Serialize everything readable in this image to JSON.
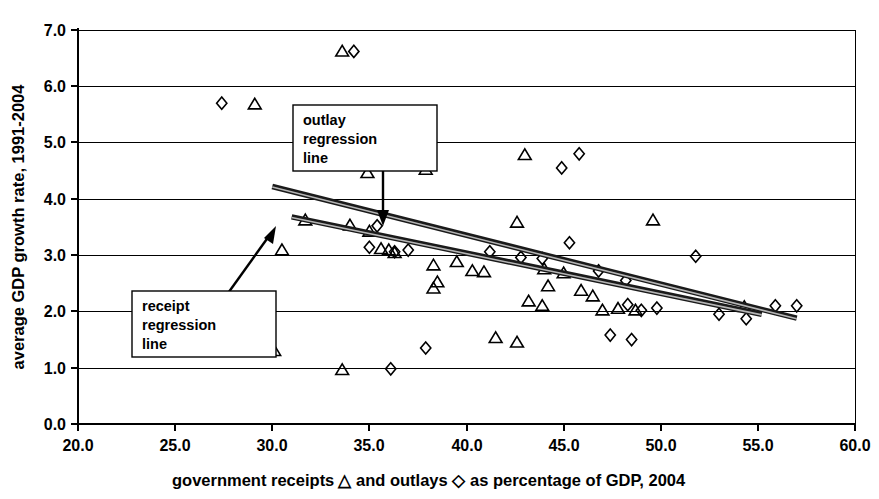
{
  "chart_data": {
    "type": "scatter",
    "title": "",
    "xlabel": "government receipts △ and outlays ◇ as percentage of GDP, 2004",
    "ylabel": "average GDP growth rate, 1991-2004",
    "xlim": [
      20.0,
      60.0
    ],
    "ylim": [
      0.0,
      7.0
    ],
    "xticks": [
      "20.0",
      "25.0",
      "30.0",
      "35.0",
      "40.0",
      "45.0",
      "50.0",
      "55.0",
      "60.0"
    ],
    "yticks": [
      "0.0",
      "1.0",
      "2.0",
      "3.0",
      "4.0",
      "5.0",
      "6.0",
      "7.0"
    ],
    "xtick_values": [
      20.0,
      25.0,
      30.0,
      35.0,
      40.0,
      45.0,
      50.0,
      55.0,
      60.0
    ],
    "ytick_values": [
      0.0,
      1.0,
      2.0,
      3.0,
      4.0,
      5.0,
      6.0,
      7.0
    ],
    "grid": "horizontal",
    "legend_position": "in-axis-title",
    "series": [
      {
        "name": "government receipts",
        "marker": "triangle",
        "points": [
          [
            33.6,
            6.62
          ],
          [
            29.1,
            5.68
          ],
          [
            34.9,
            4.46
          ],
          [
            37.9,
            4.52
          ],
          [
            43.0,
            4.78
          ],
          [
            31.7,
            3.62
          ],
          [
            30.5,
            3.09
          ],
          [
            34.0,
            3.53
          ],
          [
            35.0,
            3.42
          ],
          [
            35.6,
            3.11
          ],
          [
            36.0,
            3.09
          ],
          [
            36.3,
            3.04
          ],
          [
            38.3,
            2.82
          ],
          [
            38.5,
            2.52
          ],
          [
            38.3,
            2.41
          ],
          [
            39.5,
            2.88
          ],
          [
            40.3,
            2.72
          ],
          [
            40.9,
            2.7
          ],
          [
            42.6,
            3.58
          ],
          [
            44.0,
            2.75
          ],
          [
            44.2,
            2.45
          ],
          [
            43.2,
            2.18
          ],
          [
            43.9,
            2.1
          ],
          [
            45.0,
            2.68
          ],
          [
            45.9,
            2.37
          ],
          [
            46.5,
            2.27
          ],
          [
            47.0,
            2.02
          ],
          [
            47.8,
            2.05
          ],
          [
            48.7,
            2.02
          ],
          [
            49.6,
            3.62
          ],
          [
            54.3,
            2.08
          ],
          [
            41.5,
            1.53
          ],
          [
            42.6,
            1.45
          ],
          [
            30.1,
            1.3
          ],
          [
            33.6,
            0.96
          ]
        ]
      },
      {
        "name": "government outlays",
        "marker": "diamond",
        "points": [
          [
            34.2,
            6.62
          ],
          [
            27.4,
            5.7
          ],
          [
            45.8,
            4.8
          ],
          [
            44.9,
            4.55
          ],
          [
            35.0,
            3.14
          ],
          [
            35.4,
            3.52
          ],
          [
            36.3,
            3.06
          ],
          [
            37.0,
            3.09
          ],
          [
            41.2,
            3.06
          ],
          [
            42.8,
            2.96
          ],
          [
            43.9,
            2.94
          ],
          [
            45.3,
            3.22
          ],
          [
            46.8,
            2.72
          ],
          [
            48.2,
            2.55
          ],
          [
            48.3,
            2.12
          ],
          [
            49.0,
            2.02
          ],
          [
            49.8,
            2.06
          ],
          [
            51.8,
            2.98
          ],
          [
            53.0,
            1.95
          ],
          [
            54.4,
            1.87
          ],
          [
            55.9,
            2.1
          ],
          [
            57.0,
            2.1
          ],
          [
            47.4,
            1.58
          ],
          [
            48.5,
            1.5
          ],
          [
            37.9,
            1.35
          ],
          [
            36.1,
            0.98
          ]
        ]
      }
    ],
    "regression_lines": [
      {
        "name": "outlay regression line",
        "label": "outlay\nregression\nline",
        "x_start": 30.0,
        "y_start": 4.22,
        "x_end": 57.0,
        "y_end": 1.88
      },
      {
        "name": "receipt regression line",
        "label": "receipt\nregression\nline",
        "x_start": 31.0,
        "y_start": 3.68,
        "x_end": 55.2,
        "y_end": 1.95
      }
    ],
    "annotations": [
      {
        "id": "outlay-callout",
        "line1": "outlay",
        "line2": "regression",
        "line3": "line"
      },
      {
        "id": "receipt-callout",
        "line1": "receipt",
        "line2": "regression",
        "line3": "line"
      }
    ]
  },
  "axes": {
    "y_title": "average GDP growth rate, 1991-2004",
    "x_title_part1": "government receipts",
    "x_title_marker1": "△",
    "x_title_part2": "and outlays",
    "x_title_marker2": "◇",
    "x_title_part3": "as percentage of GDP, 2004"
  }
}
